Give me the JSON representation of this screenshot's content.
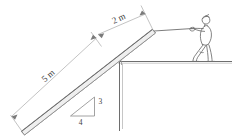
{
  "figure": {
    "type": "engineering-statics-free-body-diagram",
    "background_color": "#ffffff",
    "line_color": "#6e6e6e",
    "text_color": "#3c3c3c"
  },
  "labels": {
    "plank_total_length": "5 m",
    "plank_overhang": "2 m",
    "slope_rise": "3",
    "slope_run": "4"
  },
  "elements": {
    "plank_name": "inclined plank",
    "rope_name": "rope",
    "person_name": "person pulling rope",
    "wall_name": "vertical wall",
    "ground_name": "ground line",
    "ledge_name": "ledge corner",
    "slope_triangle_name": "slope triangle"
  }
}
